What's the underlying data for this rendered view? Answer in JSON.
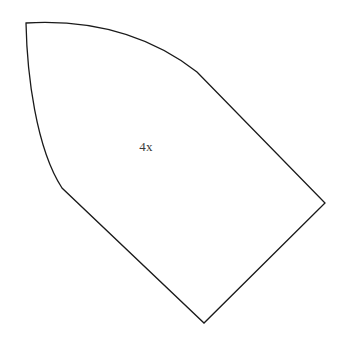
{
  "figure": {
    "canvas": {
      "width": 344,
      "height": 346,
      "background_color": "#ffffff"
    },
    "style": {
      "stroke_color": "#1a1a1a",
      "stroke_width": 1.3,
      "fill_color": "#ffffff",
      "label_color": "#3a3a3a",
      "label_font_size": 13
    },
    "shape": {
      "name": "curved-quadrilateral",
      "description": "Closed region bounded by one large arc on the upper-left and three straight edges forming a point at the right and at the bottom",
      "vertices": [
        {
          "name": "top-left-corner",
          "x": 26,
          "y": 23
        },
        {
          "name": "arc-tangent-upper-right",
          "x": 197,
          "y": 72
        },
        {
          "name": "right-vertex",
          "x": 325,
          "y": 203
        },
        {
          "name": "bottom-vertex",
          "x": 204,
          "y": 323
        },
        {
          "name": "arc-tangent-lower-left",
          "x": 62,
          "y": 188
        }
      ],
      "arc_control_points": {
        "upper_arc_c1": {
          "x": 95,
          "y": 19
        },
        "upper_arc_c2": {
          "x": 152,
          "y": 37
        },
        "lower_arc_c1": {
          "x": 36,
          "y": 148
        },
        "lower_arc_c2": {
          "x": 27,
          "y": 74
        }
      },
      "path_d": "M 26 23 C 95 19 152 37 197 72 L 325 203 L 204 323 L 62 188 C 36 148 27 74 26 23 Z"
    },
    "labels": [
      {
        "name": "region-label",
        "text": "4x",
        "x": 146,
        "y": 148
      }
    ]
  }
}
